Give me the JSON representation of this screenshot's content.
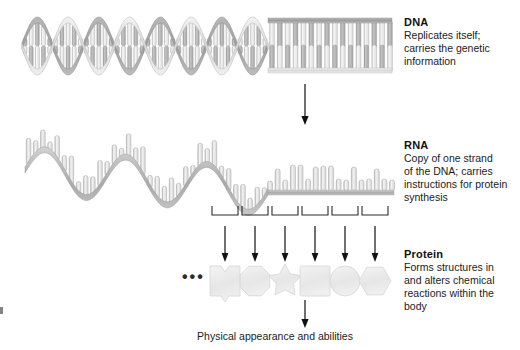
{
  "figure": {
    "background": "#ffffff",
    "caption": "Physical appearance and abilities"
  },
  "dna": {
    "title": "DNA",
    "line1": "Replicates itself;",
    "line2": "carries the genetic",
    "line3": "information",
    "helix_turns": 4,
    "straight_rungs": 16,
    "colors": {
      "ribbon_light": "#e3e3e3",
      "ribbon_dark": "#a8a8a8",
      "rung_light": "#ededed",
      "rung_dark": "#b4b4b4",
      "outline": "#9a9a9a"
    }
  },
  "rna": {
    "title": "RNA",
    "line1": "Copy of one strand",
    "line2": "of the  DNA; carries",
    "line3": "instructions for protein",
    "line4": "synthesis",
    "waves": 3,
    "straight_bases": 17,
    "colors": {
      "backbone": "#b9b9b9",
      "base_fill": "#e8e8e8",
      "outline": "#9a9a9a"
    }
  },
  "protein": {
    "title": "Protein",
    "line1": "Forms structures in",
    "line2": "and alters chemical",
    "line3": "reactions within the",
    "line4": "body",
    "ellipsis": "•••",
    "shapes": [
      {
        "name": "amino-acid-notched-square",
        "type": "notched-square"
      },
      {
        "name": "amino-acid-octagon",
        "type": "octagon"
      },
      {
        "name": "amino-acid-star",
        "type": "star"
      },
      {
        "name": "amino-acid-square",
        "type": "square"
      },
      {
        "name": "amino-acid-circle",
        "type": "circle"
      },
      {
        "name": "amino-acid-hexagon",
        "type": "hexagon"
      }
    ],
    "colors": {
      "fill": "#ececec",
      "outline": "#d6d6d6"
    }
  },
  "codons": {
    "count": 6,
    "bracket_color": "#2b2b2b",
    "arrow_color": "#111111"
  },
  "arrows": {
    "dna_to_rna": {
      "name": "arrow-dna-to-rna"
    },
    "protein_to_phenotype": {
      "name": "arrow-protein-to-phenotype"
    },
    "color": "#111111"
  }
}
